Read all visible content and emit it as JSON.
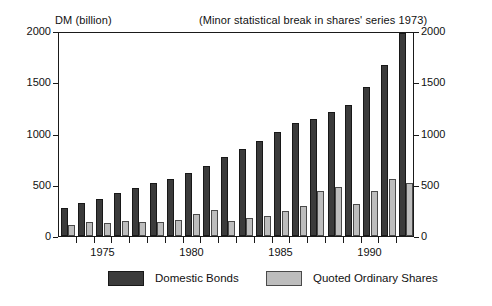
{
  "chart_data": {
    "type": "bar",
    "title": "",
    "annotation": "(Minor statistical break in shares' series 1973)",
    "ylabel": "DM (billion)",
    "xlabel": "",
    "ylim": [
      0,
      2000
    ],
    "ytick_labels": [
      "0",
      "500",
      "1000",
      "1500",
      "2000"
    ],
    "ytick_values": [
      0,
      500,
      1000,
      1500,
      2000
    ],
    "grid": false,
    "legend_position": "bottom",
    "axis_right_labels": [
      "0",
      "500",
      "1000",
      "1500",
      "2000"
    ],
    "categories": [
      "1973",
      "1974",
      "1975",
      "1976",
      "1977",
      "1978",
      "1979",
      "1980",
      "1981",
      "1982",
      "1983",
      "1984",
      "1985",
      "1986",
      "1987",
      "1988",
      "1989",
      "1990",
      "1991",
      "1992"
    ],
    "xtick_labels": [
      "1975",
      "1980",
      "1985",
      "1990"
    ],
    "xtick_categories": [
      "1975",
      "1980",
      "1985",
      "1990"
    ],
    "series": [
      {
        "name": "Domestic Bonds",
        "color": "#3b3b3b",
        "values": [
          275,
          320,
          365,
          420,
          465,
          515,
          555,
          615,
          680,
          775,
          845,
          930,
          1015,
          1105,
          1145,
          1210,
          1275,
          1450,
          1670,
          1980
        ]
      },
      {
        "name": "Quoted Ordinary Shares",
        "color": "#bdbdbd",
        "values": [
          110,
          140,
          130,
          145,
          140,
          140,
          155,
          210,
          250,
          150,
          175,
          200,
          240,
          290,
          435,
          480,
          315,
          440,
          555,
          515
        ]
      }
    ]
  },
  "legend": {
    "items": [
      {
        "label": "Domestic Bonds"
      },
      {
        "label": "Quoted Ordinary Shares"
      }
    ]
  }
}
